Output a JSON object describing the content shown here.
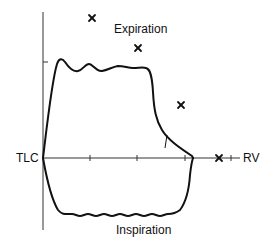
{
  "diagram": {
    "labels": {
      "expiration": "Expiration",
      "inspiration": "Inspiration",
      "tlc": "TLC",
      "rv": "RV"
    },
    "markers": {
      "symbol": "×",
      "count": 4
    },
    "colors": {
      "line": "#111111",
      "axis": "#333333",
      "background": "#ffffff"
    }
  }
}
